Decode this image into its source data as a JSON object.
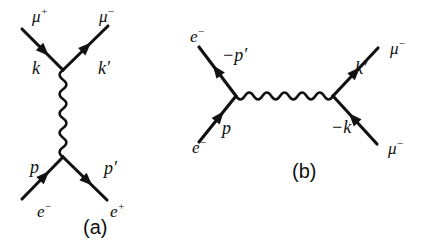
{
  "figure": {
    "background_color": "#ffffff",
    "line_color": "#111111",
    "width": 426,
    "height": 250
  },
  "panels": [
    {
      "id": "panel-a",
      "caption": "(a)",
      "caption_x": 83,
      "caption_y": 229,
      "channel": "s-channel annihilation",
      "vertices": [
        {
          "name": "upper-vertex",
          "x": 63,
          "y": 70
        },
        {
          "name": "lower-vertex",
          "x": 63,
          "y": 157
        }
      ],
      "propagator": {
        "name": "photon-propagator-vertical",
        "type": "photon",
        "orientation": "vertical",
        "x1": 63,
        "y1": 70,
        "x2": 63,
        "y2": 157
      },
      "legs": [
        {
          "name": "leg-mu-plus-in",
          "particle": "μ",
          "charge": "+",
          "momentum": "k",
          "particle_x": 32,
          "particle_y": 18,
          "momentum_x": 32,
          "momentum_y": 70,
          "x1": 22,
          "y1": 29,
          "x2": 63,
          "y2": 70,
          "arrow_t": 0.54,
          "arrow_direction": "toward-vertex"
        },
        {
          "name": "leg-mu-minus-out",
          "particle": "μ",
          "charge": "−",
          "momentum": "k′",
          "particle_x": 99,
          "particle_y": 18,
          "momentum_x": 98,
          "momentum_y": 70,
          "x1": 63,
          "y1": 70,
          "x2": 108,
          "y2": 26,
          "arrow_t": 0.52,
          "arrow_direction": "away-from-vertex"
        },
        {
          "name": "leg-electron-in",
          "particle": "e",
          "charge": "−",
          "momentum": "p",
          "particle_x": 37,
          "particle_y": 213,
          "momentum_x": 30,
          "momentum_y": 169,
          "x1": 22,
          "y1": 199,
          "x2": 63,
          "y2": 157,
          "arrow_t": 0.55,
          "arrow_direction": "toward-vertex"
        },
        {
          "name": "leg-positron-out",
          "particle": "e",
          "charge": "+",
          "momentum": "p′",
          "particle_x": 110,
          "particle_y": 213,
          "momentum_x": 104,
          "momentum_y": 170,
          "x1": 63,
          "y1": 157,
          "x2": 107,
          "y2": 200,
          "arrow_t": 0.56,
          "arrow_direction": "away-from-vertex"
        }
      ]
    },
    {
      "id": "panel-b",
      "caption": "(b)",
      "caption_x": 292,
      "caption_y": 173,
      "channel": "t-channel crossed scattering",
      "vertices": [
        {
          "name": "left-vertex",
          "x": 236,
          "y": 96
        },
        {
          "name": "right-vertex",
          "x": 333,
          "y": 96
        }
      ],
      "propagator": {
        "name": "photon-propagator-horizontal",
        "type": "photon",
        "orientation": "horizontal",
        "x1": 236,
        "y1": 96,
        "x2": 333,
        "y2": 96
      },
      "legs": [
        {
          "name": "leg-electron-upper-out",
          "particle": "e",
          "charge": "−",
          "momentum": "−p′",
          "particle_x": 190,
          "particle_y": 38,
          "momentum_x": 222,
          "momentum_y": 57,
          "x1": 236,
          "y1": 96,
          "x2": 199,
          "y2": 47,
          "arrow_t": 0.52,
          "arrow_direction": "away-from-vertex"
        },
        {
          "name": "leg-electron-lower-in",
          "particle": "e",
          "charge": "−",
          "momentum": "p",
          "particle_x": 192,
          "particle_y": 149,
          "momentum_x": 222,
          "momentum_y": 130,
          "x1": 199,
          "y1": 142,
          "x2": 236,
          "y2": 96,
          "arrow_t": 0.56,
          "arrow_direction": "toward-vertex"
        },
        {
          "name": "leg-muon-upper-out",
          "particle": "μ",
          "charge": "−",
          "momentum": "k′",
          "particle_x": 390,
          "particle_y": 50,
          "momentum_x": 355,
          "momentum_y": 70,
          "x1": 333,
          "y1": 96,
          "x2": 378,
          "y2": 48,
          "arrow_t": 0.5,
          "arrow_direction": "away-from-vertex"
        },
        {
          "name": "leg-muon-lower-in",
          "particle": "μ",
          "charge": "−",
          "momentum": "−k",
          "particle_x": 388,
          "particle_y": 150,
          "momentum_x": 331,
          "momentum_y": 129,
          "x1": 377,
          "y1": 144,
          "x2": 333,
          "y2": 96,
          "arrow_t": 0.54,
          "arrow_direction": "toward-vertex"
        }
      ]
    }
  ]
}
